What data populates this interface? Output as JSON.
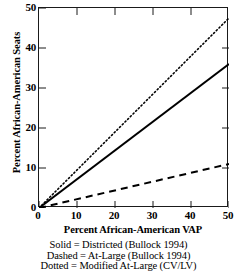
{
  "chart_data": {
    "type": "line",
    "title": "",
    "xlabel": "Percent African-American VAP",
    "ylabel": "Percent African-American Seats",
    "xlim": [
      0,
      50
    ],
    "ylim": [
      0,
      50
    ],
    "xticks": [
      "0",
      "10",
      "20",
      "30",
      "40",
      "50"
    ],
    "yticks": [
      "0",
      "10",
      "20",
      "30",
      "40",
      "50"
    ],
    "grid": false,
    "legend_position": "below-plot",
    "series": [
      {
        "name": "Districted (Bullock 1994)",
        "style": "solid",
        "color": "#000000",
        "x": [
          0,
          50
        ],
        "values": [
          0,
          36
        ]
      },
      {
        "name": "At-Large (Bullock 1994)",
        "style": "dashed",
        "color": "#000000",
        "x": [
          0,
          50
        ],
        "values": [
          0,
          11
        ]
      },
      {
        "name": "Modified At-Large (CV/LV)",
        "style": "dotted",
        "color": "#000000",
        "x": [
          0,
          50
        ],
        "values": [
          0,
          47.5
        ]
      }
    ]
  },
  "caption": {
    "lines": [
      "Solid = Districted (Bullock 1994)",
      "Dashed = At-Large (Bullock 1994)",
      "Dotted = Modified At-Large (CV/LV)"
    ]
  },
  "colors": {
    "axis": "#1a1a1a",
    "ink": "#000000",
    "background": "#ffffff"
  }
}
